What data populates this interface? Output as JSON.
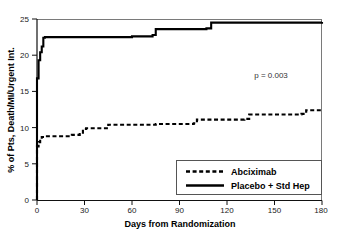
{
  "chart_data": {
    "type": "line",
    "title": "",
    "subtitle": "",
    "xlabel": "Days from Randomization",
    "ylabel": "% of Pts, Death/MI/Urgent Int.",
    "xlim": [
      0,
      180
    ],
    "ylim": [
      0,
      25
    ],
    "xticks": [
      0,
      30,
      60,
      90,
      120,
      150,
      180
    ],
    "xtick_labels": [
      "0",
      "30",
      "60",
      "90",
      "120",
      "150",
      "180"
    ],
    "yticks": [
      0,
      5,
      10,
      15,
      20,
      25
    ],
    "ytick_labels": [
      "0",
      "5",
      "10",
      "15",
      "20",
      "25"
    ],
    "grid": false,
    "legend_position": "lower right",
    "annotations": [
      {
        "name": "p-value",
        "text": "p = 0.003",
        "x": 148,
        "y": 17.0
      }
    ],
    "series": [
      {
        "name": "Abciximab",
        "style": "dashed",
        "color": "#000000",
        "points": [
          [
            0,
            0.0
          ],
          [
            0,
            7.4
          ],
          [
            1,
            8.0
          ],
          [
            2,
            8.4
          ],
          [
            3,
            8.7
          ],
          [
            5,
            8.8
          ],
          [
            20,
            8.8
          ],
          [
            22,
            9.0
          ],
          [
            27,
            9.1
          ],
          [
            29,
            9.8
          ],
          [
            31,
            9.9
          ],
          [
            43,
            9.9
          ],
          [
            45,
            10.4
          ],
          [
            60,
            10.4
          ],
          [
            75,
            10.5
          ],
          [
            90,
            10.5
          ],
          [
            99,
            10.6
          ],
          [
            101,
            11.1
          ],
          [
            120,
            11.1
          ],
          [
            131,
            11.2
          ],
          [
            134,
            11.8
          ],
          [
            150,
            11.8
          ],
          [
            167,
            11.9
          ],
          [
            170,
            12.4
          ],
          [
            180,
            12.4
          ]
        ]
      },
      {
        "name": "Placebo + Std Hep",
        "style": "solid",
        "color": "#000000",
        "points": [
          [
            0,
            0.0
          ],
          [
            0,
            16.8
          ],
          [
            1,
            18.0
          ],
          [
            1,
            19.3
          ],
          [
            2,
            20.1
          ],
          [
            2,
            20.4
          ],
          [
            3,
            21.2
          ],
          [
            4,
            22.4
          ],
          [
            5,
            22.5
          ],
          [
            40,
            22.5
          ],
          [
            60,
            22.6
          ],
          [
            73,
            22.8
          ],
          [
            75,
            23.6
          ],
          [
            90,
            23.6
          ],
          [
            107,
            23.7
          ],
          [
            110,
            24.5
          ],
          [
            150,
            24.5
          ],
          [
            180,
            24.6
          ]
        ]
      }
    ],
    "legend": [
      {
        "label": "Abciximab",
        "style": "dashed"
      },
      {
        "label": "Placebo + Std Hep",
        "style": "solid"
      }
    ]
  }
}
